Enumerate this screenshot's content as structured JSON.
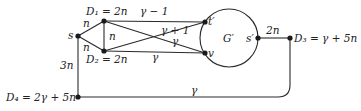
{
  "diagram": {
    "type": "graph",
    "colors": {
      "ink": "#222222",
      "background": "#ffffff"
    },
    "nodes": {
      "s": {
        "label": "s"
      },
      "D1": {
        "label": "D₁ = 2n"
      },
      "D2": {
        "label": "D₂ = 2n"
      },
      "t_prime": {
        "label": "t′"
      },
      "v": {
        "label": "v"
      },
      "s_prime": {
        "label": "s′"
      },
      "D3": {
        "label": "D₃ = γ + 5n"
      },
      "D4": {
        "label": "D₄ = 2γ + 5n"
      },
      "G_prime": {
        "label": "G′"
      }
    },
    "edges": {
      "s_D1": "n",
      "s_D2": "n",
      "D1_D2": "n",
      "D1_t": "γ − 1",
      "D1_v": "γ",
      "D2_t": "γ + 1",
      "D2_v": "γ",
      "s_D4": "3n",
      "sp_D3": "2n",
      "D4_D3": "γ"
    }
  }
}
